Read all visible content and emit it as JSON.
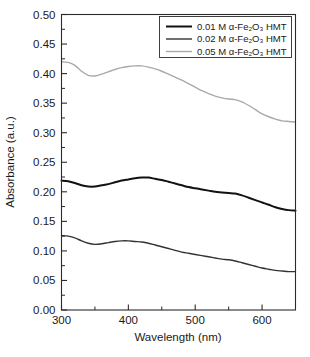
{
  "chart_data": {
    "type": "line",
    "title": "",
    "xlabel": "Wavelength (nm)",
    "ylabel": "Absorbance (a.u.)",
    "xlim": [
      300,
      650
    ],
    "ylim": [
      0.0,
      0.5
    ],
    "xticks": [
      300,
      400,
      500,
      600
    ],
    "xtick_labels": [
      "300",
      "400",
      "500",
      "600"
    ],
    "xticks_minor": [
      350,
      450,
      550,
      650
    ],
    "yticks": [
      0.0,
      0.05,
      0.1,
      0.15,
      0.2,
      0.25,
      0.3,
      0.35,
      0.4,
      0.45,
      0.5
    ],
    "ytick_labels": [
      "0.00",
      "0.05",
      "0.10",
      "0.15",
      "0.20",
      "0.25",
      "0.30",
      "0.35",
      "0.40",
      "0.45",
      "0.50"
    ],
    "grid": false,
    "legend_position": "top-right",
    "series": [
      {
        "name": "0.01 M α-Fe₂O₃ HMT",
        "color": "#111111",
        "width": 2.0,
        "x": [
          300,
          310,
          320,
          330,
          340,
          350,
          360,
          370,
          380,
          390,
          400,
          410,
          420,
          430,
          440,
          450,
          460,
          470,
          480,
          490,
          500,
          510,
          520,
          530,
          540,
          550,
          560,
          570,
          580,
          590,
          600,
          610,
          620,
          630,
          640,
          650
        ],
        "y": [
          0.219,
          0.218,
          0.215,
          0.211,
          0.209,
          0.209,
          0.211,
          0.213,
          0.216,
          0.219,
          0.221,
          0.223,
          0.224,
          0.224,
          0.222,
          0.22,
          0.217,
          0.214,
          0.211,
          0.208,
          0.206,
          0.204,
          0.202,
          0.2,
          0.199,
          0.198,
          0.197,
          0.194,
          0.19,
          0.186,
          0.182,
          0.178,
          0.174,
          0.171,
          0.169,
          0.168
        ]
      },
      {
        "name": "0.02 M α-Fe₂O₃ HMT",
        "color": "#333333",
        "width": 1.4,
        "x": [
          300,
          310,
          320,
          330,
          340,
          350,
          360,
          370,
          380,
          390,
          400,
          410,
          420,
          430,
          440,
          450,
          460,
          470,
          480,
          490,
          500,
          510,
          520,
          530,
          540,
          550,
          560,
          570,
          580,
          590,
          600,
          610,
          620,
          630,
          640,
          650
        ],
        "y": [
          0.126,
          0.125,
          0.122,
          0.117,
          0.113,
          0.111,
          0.112,
          0.114,
          0.116,
          0.117,
          0.117,
          0.116,
          0.115,
          0.113,
          0.11,
          0.107,
          0.104,
          0.101,
          0.098,
          0.096,
          0.094,
          0.092,
          0.09,
          0.088,
          0.086,
          0.085,
          0.083,
          0.08,
          0.077,
          0.074,
          0.071,
          0.069,
          0.067,
          0.066,
          0.065,
          0.065
        ]
      },
      {
        "name": "0.05 M α-Fe₂O₃ HMT",
        "color": "#a9a9a9",
        "width": 1.4,
        "x": [
          300,
          310,
          320,
          330,
          340,
          350,
          360,
          370,
          380,
          390,
          400,
          410,
          420,
          430,
          440,
          450,
          460,
          470,
          480,
          490,
          500,
          510,
          520,
          530,
          540,
          550,
          560,
          570,
          580,
          590,
          600,
          610,
          620,
          630,
          640,
          650
        ],
        "y": [
          0.42,
          0.419,
          0.414,
          0.404,
          0.397,
          0.396,
          0.399,
          0.403,
          0.407,
          0.41,
          0.412,
          0.413,
          0.413,
          0.411,
          0.408,
          0.404,
          0.399,
          0.394,
          0.389,
          0.383,
          0.377,
          0.371,
          0.366,
          0.362,
          0.359,
          0.357,
          0.356,
          0.352,
          0.346,
          0.339,
          0.332,
          0.327,
          0.323,
          0.32,
          0.319,
          0.318
        ]
      }
    ]
  },
  "legend": {
    "entries": [
      {
        "label": "0.01 M α-Fe₂O₃ HMT"
      },
      {
        "label": "0.02 M α-Fe₂O₃ HMT"
      },
      {
        "label": "0.05 M α-Fe₂O₃ HMT"
      }
    ]
  }
}
